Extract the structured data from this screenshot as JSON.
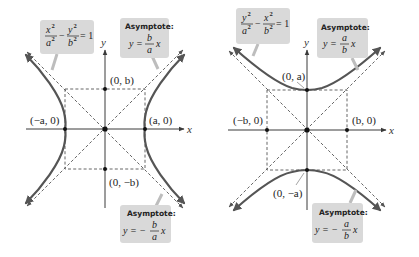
{
  "figure": {
    "left_panel": {
      "description": "Hyperbola with horizontal transverse axis",
      "equation": {
        "lhs_num1": "x",
        "lhs_den1": "a",
        "minus": "−",
        "lhs_num2": "y",
        "lhs_den2": "b",
        "exp": "2",
        "rhs": "= 1"
      },
      "asymptote_pos": {
        "title": "Asymptote:",
        "prefix": "y =",
        "num": "b",
        "den": "a",
        "var": "x",
        "sign": ""
      },
      "asymptote_neg": {
        "title": "Asymptote:",
        "prefix": "y = −",
        "num": "b",
        "den": "a",
        "var": "x"
      },
      "points": {
        "left_vertex": "(−a, 0)",
        "right_vertex": "(a, 0)",
        "top": "(0, b)",
        "bottom": "(0, −b)"
      },
      "axes": {
        "x": "x",
        "y": "y"
      }
    },
    "right_panel": {
      "description": "Hyperbola with vertical transverse axis",
      "equation": {
        "lhs_num1": "y",
        "lhs_den1": "a",
        "minus": "−",
        "lhs_num2": "x",
        "lhs_den2": "b",
        "exp": "2",
        "rhs": "= 1"
      },
      "asymptote_pos": {
        "title": "Asymptote:",
        "prefix": "y =",
        "num": "a",
        "den": "b",
        "var": "x"
      },
      "asymptote_neg": {
        "title": "Asymptote:",
        "prefix": "y = −",
        "num": "a",
        "den": "b",
        "var": "x"
      },
      "points": {
        "top_vertex": "(0, a)",
        "bottom_vertex": "(0, −a)",
        "left": "(−b, 0)",
        "right": "(b, 0)"
      },
      "axes": {
        "x": "x",
        "y": "y"
      }
    },
    "colors": {
      "curve": "#555555",
      "callout_bg": "#d9d9d9",
      "axis": "#3a3a3a"
    }
  }
}
